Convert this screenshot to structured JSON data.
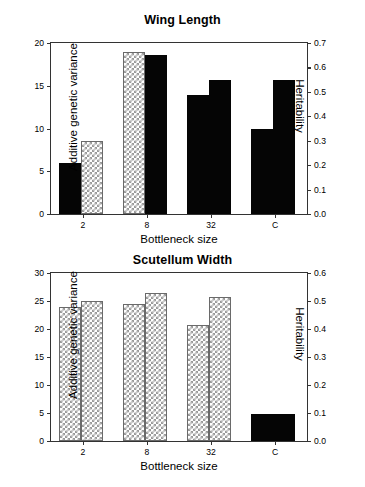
{
  "figure": {
    "width": 365,
    "height": 487,
    "background": "#ffffff",
    "bar_solid_color": "#050505",
    "bar_checker_color": "#9a9a9a",
    "axis_color": "#333333"
  },
  "chart_data": [
    {
      "type": "bar",
      "title": "Wing Length",
      "xlabel": "Bottleneck size",
      "ylabel": "Additive genetic variance",
      "y2label": "Heritability",
      "categories": [
        "2",
        "8",
        "32",
        "C"
      ],
      "ylim": [
        0,
        20
      ],
      "yticks": [
        0,
        5,
        10,
        15,
        20
      ],
      "yticklabels": [
        "0",
        "5",
        "10",
        "15",
        "20"
      ],
      "y2lim": [
        0.0,
        0.7
      ],
      "y2ticks": [
        0.0,
        0.1,
        0.2,
        0.3,
        0.4,
        0.5,
        0.6,
        0.7
      ],
      "y2ticklabels": [
        "0.0",
        "0.1",
        "0.2",
        "0.3",
        "0.4",
        "0.5",
        "0.6",
        "0.7"
      ],
      "grid": false,
      "legend": "none",
      "series": [
        {
          "name": "Additive genetic variance",
          "axis": "left",
          "values": [
            6.0,
            18.9,
            13.9,
            9.9
          ],
          "fills": [
            "solid",
            "checker",
            "solid",
            "solid"
          ]
        },
        {
          "name": "Heritability",
          "axis": "right",
          "values": [
            0.3,
            0.65,
            0.55,
            0.55
          ],
          "fills": [
            "checker",
            "solid",
            "solid",
            "solid"
          ]
        }
      ],
      "bars": [
        {
          "group": "2",
          "index": 0,
          "value": 6.0,
          "axis": "left",
          "fill": "solid"
        },
        {
          "group": "2",
          "index": 1,
          "value": 0.3,
          "axis": "right",
          "fill": "checker"
        },
        {
          "group": "8",
          "index": 0,
          "value": 18.9,
          "axis": "left",
          "fill": "checker"
        },
        {
          "group": "8",
          "index": 1,
          "value": 0.65,
          "axis": "right",
          "fill": "solid"
        },
        {
          "group": "32",
          "index": 0,
          "value": 13.9,
          "axis": "left",
          "fill": "solid"
        },
        {
          "group": "32",
          "index": 1,
          "value": 0.55,
          "axis": "right",
          "fill": "solid"
        },
        {
          "group": "C",
          "index": 0,
          "value": 9.9,
          "axis": "left",
          "fill": "solid"
        },
        {
          "group": "C",
          "index": 1,
          "value": 0.55,
          "axis": "right",
          "fill": "solid"
        }
      ]
    },
    {
      "type": "bar",
      "title": "Scutellum Width",
      "xlabel": "Bottleneck size",
      "ylabel": "Additive genetic variance",
      "y2label": "Heritability",
      "categories": [
        "2",
        "8",
        "32",
        "C"
      ],
      "ylim": [
        0,
        30
      ],
      "yticks": [
        0,
        5,
        10,
        15,
        20,
        25,
        30
      ],
      "yticklabels": [
        "0",
        "5",
        "10",
        "15",
        "20",
        "25",
        "30"
      ],
      "y2lim": [
        0.0,
        0.6
      ],
      "y2ticks": [
        0.0,
        0.1,
        0.2,
        0.3,
        0.4,
        0.5,
        0.6
      ],
      "y2ticklabels": [
        "0.0",
        "0.1",
        "0.2",
        "0.3",
        "0.4",
        "0.5",
        "0.6"
      ],
      "grid": false,
      "legend": "none",
      "series": [
        {
          "name": "Additive genetic variance",
          "axis": "left",
          "values": [
            24.0,
            24.4,
            20.8,
            4.8
          ],
          "fills": [
            "checker",
            "checker",
            "checker",
            "solid"
          ]
        },
        {
          "name": "Heritability",
          "axis": "right",
          "values": [
            0.5,
            0.53,
            0.515,
            null
          ],
          "fills": [
            "checker",
            "checker",
            "checker",
            null
          ]
        }
      ],
      "bars": [
        {
          "group": "2",
          "index": 0,
          "value": 24.0,
          "axis": "left",
          "fill": "checker"
        },
        {
          "group": "2",
          "index": 1,
          "value": 0.5,
          "axis": "right",
          "fill": "checker"
        },
        {
          "group": "8",
          "index": 0,
          "value": 24.4,
          "axis": "left",
          "fill": "checker"
        },
        {
          "group": "8",
          "index": 1,
          "value": 0.53,
          "axis": "right",
          "fill": "checker"
        },
        {
          "group": "32",
          "index": 0,
          "value": 20.8,
          "axis": "left",
          "fill": "checker"
        },
        {
          "group": "32",
          "index": 1,
          "value": 0.515,
          "axis": "right",
          "fill": "checker"
        },
        {
          "group": "C",
          "index": 0,
          "value": 4.8,
          "axis": "left",
          "fill": "solid",
          "wide": true
        }
      ]
    }
  ]
}
